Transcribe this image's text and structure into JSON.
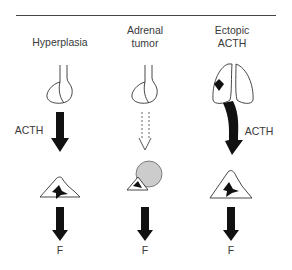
{
  "diagram": {
    "columns": [
      {
        "id": "hyperplasia",
        "title": "Hyperplasia",
        "source": "pituitary",
        "signal_label": "ACTH",
        "signal_style": "solid",
        "output_label": "F",
        "adrenal": "bilateral hyperplasia"
      },
      {
        "id": "adrenal-tumor",
        "title_line1": "Adrenal",
        "title_line2": "tumor",
        "source": "pituitary",
        "signal_style": "dashed",
        "output_label": "F",
        "adrenal": "adrenal with tumor"
      },
      {
        "id": "ectopic-acth",
        "title_line1": "Ectopic",
        "title_line2": "ACTH",
        "source": "lungs with tumor",
        "signal_label": "ACTH",
        "signal_style": "solid-curved",
        "output_label": "F",
        "adrenal": "hyperplastic adrenal"
      }
    ],
    "colors": {
      "line": "#333333",
      "fill": "#111111",
      "text": "#3a3a3a"
    }
  }
}
